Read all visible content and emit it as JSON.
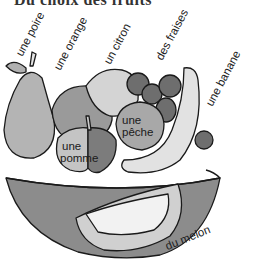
{
  "title": "Du choix des fruits",
  "labels": {
    "poire": "une poire",
    "orange": "une orange",
    "citron": "un citron",
    "fraises": "des fraises",
    "banane": "une banane",
    "peche_line1": "une",
    "peche_line2": "pêche",
    "pomme_line1": "une",
    "pomme_line2": "pomme",
    "melon": "du melon"
  },
  "colors": {
    "outline": "#1a1a1a",
    "bowl": "#8c8c8c",
    "pear": "#b4b4b4",
    "orange": "#9a9a9a",
    "lemon": "#d4d4d4",
    "strawberry": "#6e6e6e",
    "banana": "#e2e2e2",
    "peach": "#a8a8a8",
    "apple_light": "#c4c4c4",
    "apple_dark": "#7c7c7c",
    "melon_rind": "#d0d0d0",
    "melon_flesh": "#f2f2f2"
  }
}
